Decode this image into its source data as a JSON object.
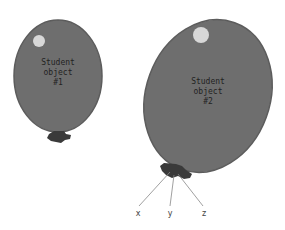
{
  "diagram": {
    "balloons": [
      {
        "lines": [
          "Student",
          "object",
          "#1"
        ]
      },
      {
        "lines": [
          "Student",
          "object",
          "#2"
        ]
      }
    ],
    "string_labels": [
      "x",
      "y",
      "z"
    ],
    "colors": {
      "balloon": "#6e6e6e",
      "balloon_edge": "#5a5a5a",
      "highlight": "#d8d8d8",
      "knot": "#3a3a3a",
      "string": "#888888"
    }
  }
}
